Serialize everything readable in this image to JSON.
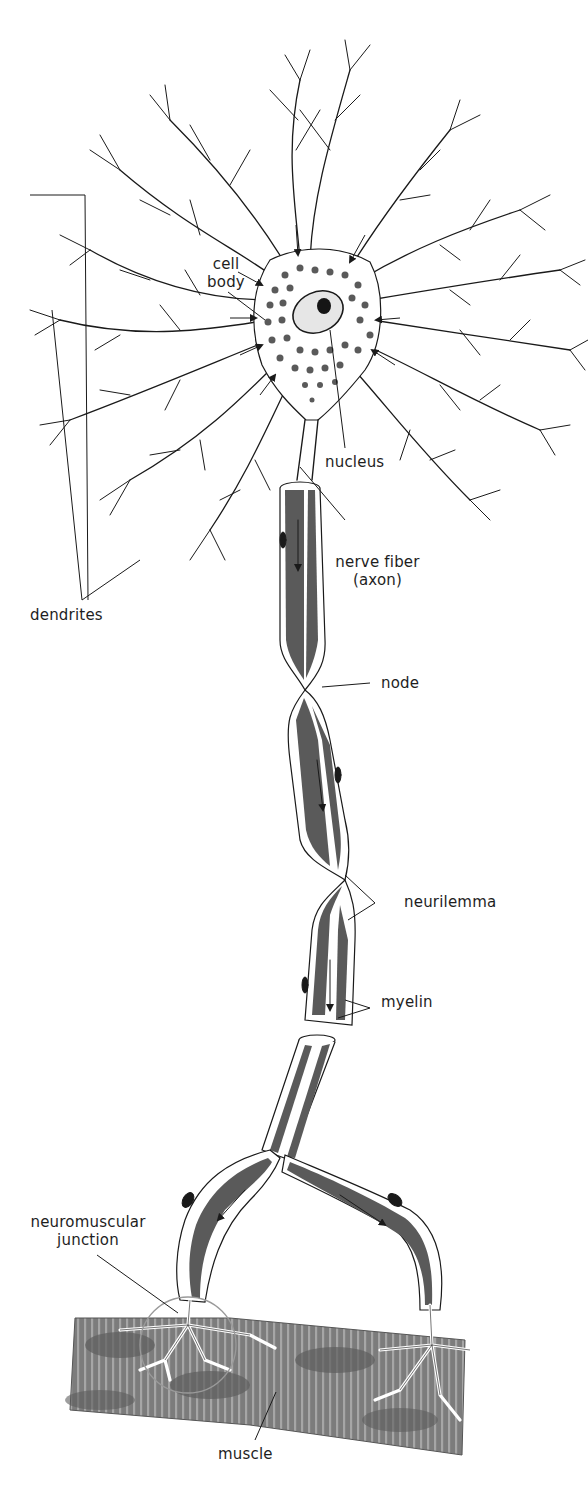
{
  "diagram": {
    "header_fragment": "",
    "colors": {
      "ink": "#1a1a1a",
      "myelin": "#555555",
      "granule": "#5a5a5a",
      "muscle": "#7a7a7a",
      "muscle_dark": "#5e5e5e",
      "nmj_circle": "#9a9a9a"
    }
  },
  "labels": {
    "cell_body_line1": "cell",
    "cell_body_line2": "body",
    "nucleus": "nucleus",
    "nerve_fiber_line1": "nerve fiber",
    "nerve_fiber_line2": "(axon)",
    "dendrites": "dendrites",
    "node": "node",
    "neurilemma": "neurilemma",
    "myelin": "myelin",
    "nmj_line1": "neuromuscular",
    "nmj_line2": "junction",
    "muscle": "muscle"
  }
}
